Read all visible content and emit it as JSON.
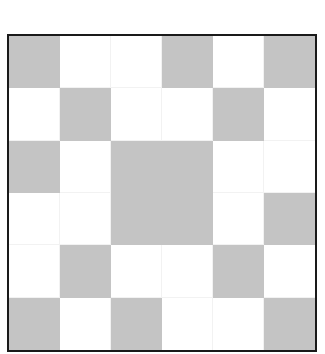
{
  "grid": {
    "rows": 6,
    "cols": 6,
    "filled_color": "#c4c4c4",
    "empty_color": "#ffffff",
    "border_color": "#1a1a1a",
    "cells": [
      [
        1,
        0,
        0,
        1,
        0,
        1
      ],
      [
        0,
        1,
        0,
        0,
        1,
        0
      ],
      [
        1,
        0,
        1,
        1,
        0,
        0
      ],
      [
        0,
        0,
        1,
        1,
        0,
        1
      ],
      [
        0,
        1,
        0,
        0,
        1,
        0
      ],
      [
        1,
        0,
        1,
        0,
        0,
        1
      ]
    ]
  }
}
